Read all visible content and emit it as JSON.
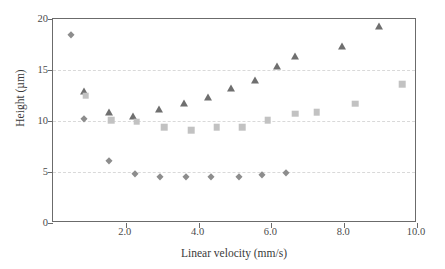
{
  "chart_data": {
    "type": "scatter",
    "title": "",
    "xlabel": "Linear velocity (mm/s)",
    "ylabel": "Height (µm)",
    "xlim": [
      0.0,
      10.0
    ],
    "ylim": [
      0,
      20
    ],
    "xticks": [
      "2.0",
      "4.0",
      "6.0",
      "8.0",
      "10.0"
    ],
    "xtick_values": [
      2.0,
      4.0,
      6.0,
      8.0,
      10.0
    ],
    "yticks": [
      "0",
      "5",
      "10",
      "15",
      "20"
    ],
    "ytick_values": [
      0,
      5,
      10,
      15,
      20
    ],
    "grid": "horizontal dashed gridlines at y = 5, 10, 15",
    "legend": "none",
    "series": [
      {
        "name": "Triangle series",
        "marker": "triangle",
        "color": "#6f6f6f",
        "points": [
          {
            "x": 0.85,
            "y": 12.9
          },
          {
            "x": 1.55,
            "y": 10.9
          },
          {
            "x": 2.2,
            "y": 10.5
          },
          {
            "x": 2.9,
            "y": 11.2
          },
          {
            "x": 3.6,
            "y": 11.8
          },
          {
            "x": 4.25,
            "y": 12.4
          },
          {
            "x": 4.9,
            "y": 13.2
          },
          {
            "x": 5.55,
            "y": 14.0
          },
          {
            "x": 6.15,
            "y": 15.4
          },
          {
            "x": 6.65,
            "y": 16.4
          },
          {
            "x": 7.95,
            "y": 17.4
          },
          {
            "x": 8.95,
            "y": 19.3
          }
        ]
      },
      {
        "name": "Square series",
        "marker": "square",
        "color": "#c2c2c2",
        "points": [
          {
            "x": 0.9,
            "y": 12.5
          },
          {
            "x": 1.6,
            "y": 10.1
          },
          {
            "x": 2.3,
            "y": 9.95
          },
          {
            "x": 3.05,
            "y": 9.4
          },
          {
            "x": 3.8,
            "y": 9.1
          },
          {
            "x": 4.5,
            "y": 9.4
          },
          {
            "x": 5.2,
            "y": 9.4
          },
          {
            "x": 5.9,
            "y": 10.1
          },
          {
            "x": 6.65,
            "y": 10.7
          },
          {
            "x": 7.25,
            "y": 10.85
          },
          {
            "x": 8.3,
            "y": 11.7
          },
          {
            "x": 9.6,
            "y": 13.6
          }
        ]
      },
      {
        "name": "Diamond series",
        "marker": "diamond",
        "color": "#8d8d8d",
        "points": [
          {
            "x": 0.5,
            "y": 18.4
          },
          {
            "x": 0.85,
            "y": 10.2
          },
          {
            "x": 1.55,
            "y": 6.1
          },
          {
            "x": 2.25,
            "y": 4.85
          },
          {
            "x": 2.95,
            "y": 4.5
          },
          {
            "x": 3.65,
            "y": 4.5
          },
          {
            "x": 4.35,
            "y": 4.5
          },
          {
            "x": 5.1,
            "y": 4.5
          },
          {
            "x": 5.75,
            "y": 4.7
          },
          {
            "x": 6.4,
            "y": 4.95
          }
        ]
      }
    ]
  },
  "axes": {
    "frame_color": "#6b6b6b",
    "grid_color": "#d9d9d9"
  }
}
